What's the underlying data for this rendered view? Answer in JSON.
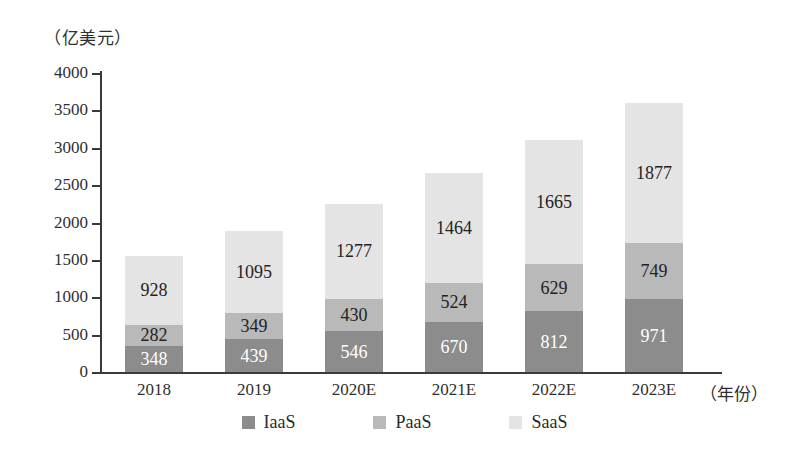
{
  "chart_data": {
    "type": "bar",
    "stacked": true,
    "title": "",
    "subtitle": "",
    "xlabel": "（年份）",
    "ylabel": "（亿美元）",
    "categories": [
      "2018",
      "2019",
      "2020E",
      "2021E",
      "2022E",
      "2023E"
    ],
    "series": [
      {
        "name": "IaaS",
        "color": "#8c8c8c",
        "values": [
          348,
          439,
          546,
          670,
          812,
          971
        ]
      },
      {
        "name": "PaaS",
        "color": "#b9b9b9",
        "values": [
          282,
          349,
          430,
          524,
          629,
          749
        ]
      },
      {
        "name": "SaaS",
        "color": "#e4e4e4",
        "values": [
          928,
          1095,
          1277,
          1464,
          1665,
          1877
        ]
      }
    ],
    "totals": [
      1558,
      1883,
      2253,
      2658,
      3106,
      3597
    ],
    "ylim": [
      0,
      4000
    ],
    "yticks": [
      "0",
      "500",
      "1000",
      "1500",
      "2000",
      "2500",
      "3000",
      "3500",
      "4000"
    ],
    "ytick_values": [
      0,
      500,
      1000,
      1500,
      2000,
      2500,
      3000,
      3500,
      4000
    ],
    "grid": false,
    "legend_position": "bottom",
    "legend": [
      "IaaS",
      "PaaS",
      "SaaS"
    ]
  },
  "axes": {
    "unit_label": "（亿美元）",
    "x_axis_title": "（年份）"
  },
  "labels": {
    "y": [
      "4000",
      "3500",
      "3000",
      "2500",
      "2000",
      "1500",
      "1000",
      "500",
      "0"
    ],
    "x": [
      "2018",
      "2019",
      "2020E",
      "2021E",
      "2022E",
      "2023E"
    ]
  },
  "bars": [
    {
      "category": "2018",
      "iaas": "348",
      "paas": "282",
      "saas": "928"
    },
    {
      "category": "2019",
      "iaas": "439",
      "paas": "349",
      "saas": "1095"
    },
    {
      "category": "2020E",
      "iaas": "546",
      "paas": "430",
      "saas": "1277"
    },
    {
      "category": "2021E",
      "iaas": "670",
      "paas": "524",
      "saas": "1464"
    },
    {
      "category": "2022E",
      "iaas": "812",
      "paas": "629",
      "saas": "1665"
    },
    {
      "category": "2023E",
      "iaas": "971",
      "paas": "749",
      "saas": "1877"
    }
  ],
  "legend": {
    "items": [
      {
        "label": "IaaS",
        "color": "#8c8c8c"
      },
      {
        "label": "PaaS",
        "color": "#b9b9b9"
      },
      {
        "label": "SaaS",
        "color": "#e4e4e4"
      }
    ]
  },
  "colors": {
    "iaas": "#8c8c8c",
    "paas": "#b9b9b9",
    "saas": "#e4e4e4",
    "axis": "#3a3a3a",
    "background": "#ffffff"
  }
}
